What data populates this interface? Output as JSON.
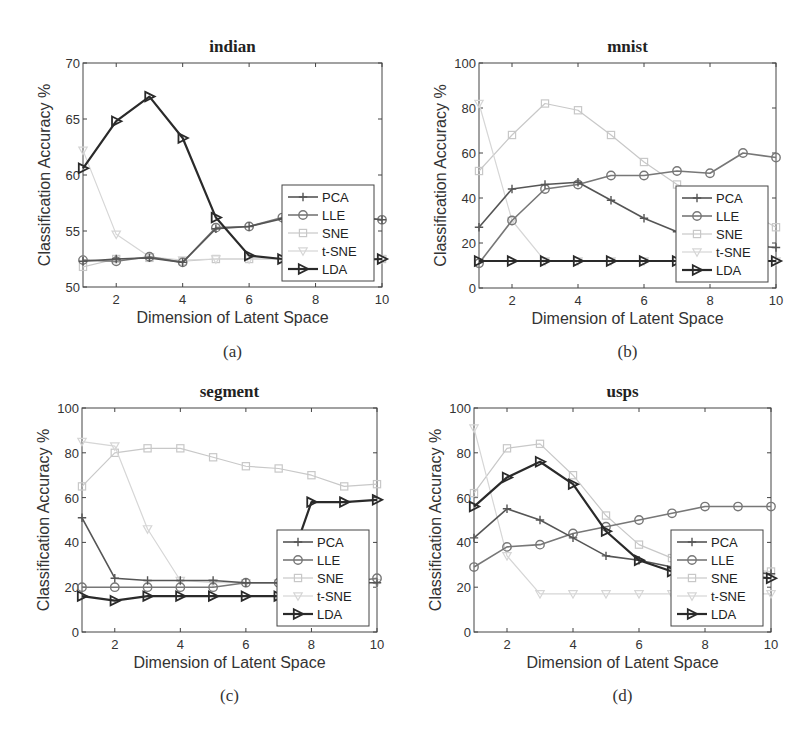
{
  "chart_data": [
    {
      "type": "line",
      "panel": "a",
      "title": "indian",
      "caption": "(a)",
      "xlabel": "Dimension of Latent Space",
      "ylabel": "Classification Accuracy %",
      "x": [
        1,
        2,
        3,
        4,
        5,
        6,
        7,
        8,
        9,
        10
      ],
      "xlim": [
        1,
        10
      ],
      "ylim": [
        50,
        70
      ],
      "xticks": [
        2,
        4,
        6,
        8,
        10
      ],
      "yticks": [
        50,
        55,
        60,
        65,
        70
      ],
      "legend_position": "lower right",
      "series": [
        {
          "name": "PCA",
          "values": [
            52.3,
            52.5,
            52.6,
            52.2,
            55.2,
            55.4,
            56.1,
            56.4,
            56.3,
            56.0
          ]
        },
        {
          "name": "LLE",
          "values": [
            52.4,
            52.3,
            52.7,
            52.2,
            55.3,
            55.4,
            56.2,
            56.5,
            56.3,
            56.0
          ]
        },
        {
          "name": "SNE",
          "values": [
            51.8,
            52.5,
            52.6,
            52.3,
            52.5,
            52.5,
            52.5,
            52.5,
            52.5,
            52.5
          ]
        },
        {
          "name": "t-SNE",
          "values": [
            62.2,
            54.7,
            52.7,
            52.4,
            52.5,
            52.5,
            52.5,
            52.5,
            52.5,
            52.5
          ]
        },
        {
          "name": "LDA",
          "values": [
            60.6,
            64.8,
            67.0,
            63.3,
            56.2,
            52.8,
            52.5,
            52.4,
            52.4,
            52.5
          ]
        }
      ]
    },
    {
      "type": "line",
      "panel": "b",
      "title": "mnist",
      "caption": "(b)",
      "xlabel": "Dimension of Latent Space",
      "ylabel": "Classification Accuracy %",
      "x": [
        1,
        2,
        3,
        4,
        5,
        6,
        7,
        8,
        9,
        10
      ],
      "xlim": [
        1,
        10
      ],
      "ylim": [
        0,
        100
      ],
      "xticks": [
        2,
        4,
        6,
        8,
        10
      ],
      "yticks": [
        0,
        20,
        40,
        60,
        80,
        100
      ],
      "legend_position": "lower right",
      "series": [
        {
          "name": "PCA",
          "values": [
            27,
            44,
            46,
            47,
            39,
            31,
            25,
            21,
            19,
            18
          ]
        },
        {
          "name": "LLE",
          "values": [
            11,
            30,
            44,
            46,
            50,
            50,
            52,
            51,
            60,
            58
          ]
        },
        {
          "name": "SNE",
          "values": [
            52,
            68,
            82,
            79,
            68,
            56,
            46,
            40,
            35,
            27
          ]
        },
        {
          "name": "t-SNE",
          "values": [
            82,
            30,
            12,
            12,
            12,
            12,
            12,
            12,
            12,
            12
          ]
        },
        {
          "name": "LDA",
          "values": [
            12,
            12,
            12,
            12,
            12,
            12,
            12,
            12,
            12,
            12
          ]
        }
      ]
    },
    {
      "type": "line",
      "panel": "c",
      "title": "segment",
      "caption": "(c)",
      "xlabel": "Dimension of Latent Space",
      "ylabel": "Classification Accuracy %",
      "x": [
        1,
        2,
        3,
        4,
        5,
        6,
        7,
        8,
        9,
        10
      ],
      "xlim": [
        1,
        10
      ],
      "ylim": [
        0,
        100
      ],
      "xticks": [
        2,
        4,
        6,
        8,
        10
      ],
      "yticks": [
        0,
        20,
        40,
        60,
        80,
        100
      ],
      "legend_position": "lower right",
      "series": [
        {
          "name": "PCA",
          "values": [
            51,
            24,
            23,
            23,
            23,
            22,
            22,
            22,
            22,
            22
          ]
        },
        {
          "name": "LLE",
          "values": [
            20,
            20,
            20,
            20,
            20,
            22,
            22,
            22,
            22,
            24
          ]
        },
        {
          "name": "SNE",
          "values": [
            65,
            80,
            82,
            82,
            78,
            74,
            73,
            70,
            65,
            66
          ]
        },
        {
          "name": "t-SNE",
          "values": [
            85,
            83,
            46,
            23,
            22,
            22,
            22,
            22,
            22,
            22
          ]
        },
        {
          "name": "LDA",
          "values": [
            16,
            14,
            16,
            16,
            16,
            16,
            16,
            58,
            58,
            59
          ]
        }
      ]
    },
    {
      "type": "line",
      "panel": "d",
      "title": "usps",
      "caption": "(d)",
      "xlabel": "Dimension of Latent Space",
      "ylabel": "Classification Accuracy %",
      "x": [
        1,
        2,
        3,
        4,
        5,
        6,
        7,
        8,
        9,
        10
      ],
      "xlim": [
        1,
        10
      ],
      "ylim": [
        0,
        100
      ],
      "xticks": [
        2,
        4,
        6,
        8,
        10
      ],
      "yticks": [
        0,
        20,
        40,
        60,
        80,
        100
      ],
      "legend_position": "lower right",
      "series": [
        {
          "name": "PCA",
          "values": [
            42,
            55,
            50,
            42,
            34,
            32,
            29,
            28,
            27,
            26
          ]
        },
        {
          "name": "LLE",
          "values": [
            29,
            38,
            39,
            44,
            47,
            50,
            53,
            56,
            56,
            56
          ]
        },
        {
          "name": "SNE",
          "values": [
            62,
            82,
            84,
            70,
            52,
            39,
            33,
            30,
            28,
            27
          ]
        },
        {
          "name": "t-SNE",
          "values": [
            91,
            34,
            17,
            17,
            17,
            17,
            17,
            17,
            17,
            17
          ]
        },
        {
          "name": "LDA",
          "values": [
            56,
            69,
            76,
            66,
            45,
            32,
            27,
            26,
            25,
            24
          ]
        }
      ]
    }
  ],
  "styles": {
    "PCA": {
      "color": "#555555",
      "marker": "plus",
      "width": 1.6
    },
    "LLE": {
      "color": "#777777",
      "marker": "circle",
      "width": 1.6
    },
    "SNE": {
      "color": "#c8c8c8",
      "marker": "square",
      "width": 1.2
    },
    "t-SNE": {
      "color": "#d6d6d6",
      "marker": "triangle-down",
      "width": 1.2
    },
    "LDA": {
      "color": "#2a2a2a",
      "marker": "triangle-right",
      "width": 2.2
    }
  }
}
